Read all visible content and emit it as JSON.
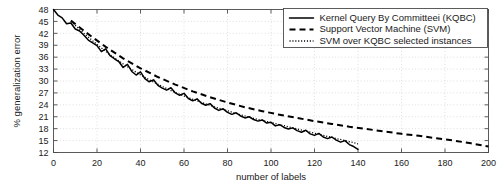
{
  "chart_data": {
    "type": "line",
    "title": "",
    "xlabel": "number of labels",
    "ylabel": "% generalization error",
    "xlim": [
      0,
      200
    ],
    "ylim": [
      12,
      48
    ],
    "grid": true,
    "legend_position": "top-right",
    "xticks": [
      0,
      20,
      40,
      60,
      80,
      100,
      120,
      140,
      160,
      180,
      200
    ],
    "yticks": [
      12,
      15,
      18,
      21,
      24,
      27,
      30,
      33,
      36,
      39,
      42,
      45,
      48
    ],
    "series": [
      {
        "name": "Kernel Query By Committeei (KQBC)",
        "style": "solid",
        "x": [
          0,
          2,
          4,
          6,
          8,
          10,
          12,
          14,
          16,
          18,
          20,
          22,
          24,
          26,
          28,
          30,
          32,
          34,
          36,
          38,
          40,
          42,
          44,
          46,
          48,
          50,
          52,
          54,
          56,
          58,
          60,
          62,
          64,
          66,
          68,
          70,
          72,
          74,
          76,
          78,
          80,
          82,
          84,
          86,
          88,
          90,
          92,
          94,
          96,
          98,
          100,
          102,
          104,
          106,
          108,
          110,
          112,
          114,
          116,
          118,
          120,
          122,
          124,
          126,
          128,
          130,
          132,
          134,
          136,
          138,
          140
        ],
        "values": [
          48.0,
          46.6,
          45.9,
          44.4,
          44.6,
          43.1,
          42.6,
          41.5,
          40.3,
          39.6,
          38.9,
          37.4,
          38.1,
          36.4,
          35.6,
          34.9,
          33.4,
          34.2,
          32.4,
          31.5,
          32.3,
          30.6,
          29.8,
          30.3,
          28.9,
          28.2,
          27.7,
          28.3,
          27.0,
          26.4,
          26.9,
          25.6,
          25.0,
          25.5,
          24.4,
          23.9,
          24.3,
          23.2,
          22.6,
          23.0,
          22.1,
          21.6,
          22.0,
          21.2,
          20.7,
          21.0,
          20.3,
          19.9,
          20.2,
          19.4,
          19.6,
          18.7,
          19.0,
          18.3,
          17.9,
          18.2,
          17.5,
          17.1,
          17.6,
          16.7,
          16.3,
          16.8,
          15.9,
          15.5,
          15.9,
          15.1,
          14.6,
          15.0,
          14.0,
          13.5,
          12.8
        ]
      },
      {
        "name": "Support Vector Machine (SVM)",
        "style": "dashed",
        "x": [
          8,
          16,
          24,
          32,
          40,
          48,
          56,
          64,
          72,
          80,
          88,
          96,
          104,
          112,
          120,
          128,
          136,
          144,
          152,
          160,
          168,
          176,
          184,
          192,
          200
        ],
        "values": [
          45.2,
          41.8,
          38.6,
          35.7,
          33.2,
          31.0,
          29.1,
          27.4,
          25.9,
          24.6,
          23.4,
          22.4,
          21.5,
          20.7,
          19.9,
          19.2,
          18.5,
          17.9,
          17.3,
          16.7,
          16.2,
          15.6,
          15.0,
          14.3,
          13.5
        ]
      },
      {
        "name": "SVM over KQBC selected instances",
        "style": "dotted",
        "x": [
          8,
          14,
          20,
          26,
          32,
          38,
          44,
          50,
          56,
          62,
          68,
          74,
          80,
          86,
          92,
          98,
          104,
          110,
          116,
          122,
          128,
          134,
          140
        ],
        "values": [
          45.0,
          42.0,
          39.2,
          36.6,
          34.3,
          32.2,
          30.3,
          28.6,
          27.1,
          25.8,
          24.6,
          23.5,
          22.5,
          21.5,
          20.6,
          19.8,
          19.0,
          18.2,
          17.4,
          16.6,
          15.8,
          15.0,
          14.2
        ]
      }
    ]
  }
}
